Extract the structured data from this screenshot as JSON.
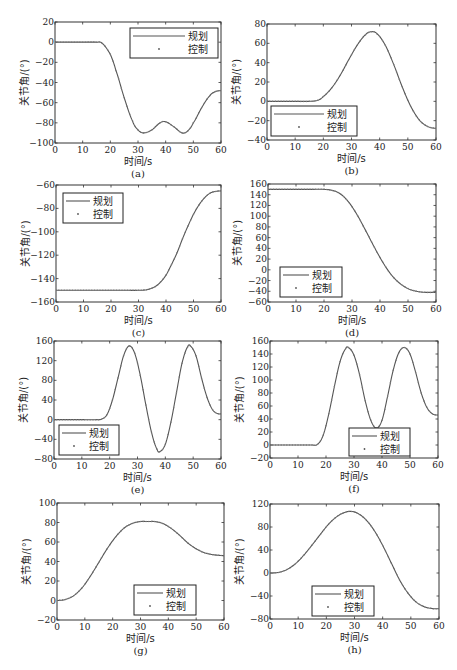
{
  "figure": {
    "legend_labels": [
      "规划",
      "控制"
    ],
    "xlabel": "时间/s",
    "ylabel": "关节角/(°)"
  },
  "chart_data": [
    {
      "id": "a",
      "caption": "(a)",
      "type": "line",
      "title": "",
      "xlabel": "时间/s",
      "ylabel": "关节角/(°)",
      "xlim": [
        0,
        60
      ],
      "ylim": [
        -100,
        20
      ],
      "xticks": [
        0,
        10,
        20,
        30,
        40,
        50,
        60
      ],
      "yticks": [
        -100,
        -80,
        -60,
        -40,
        -20,
        0,
        20
      ],
      "grid": false,
      "legend_position": "upper right",
      "legend": [
        "规划",
        "控制"
      ],
      "x": [
        0,
        5,
        10,
        15,
        17,
        20,
        22,
        25,
        28,
        30,
        32,
        35,
        38,
        40,
        43,
        46,
        48,
        50,
        53,
        56,
        58,
        60
      ],
      "series": [
        {
          "name": "规划",
          "style": "line",
          "values": [
            0,
            0,
            0,
            0,
            -1,
            -12,
            -28,
            -55,
            -78,
            -87,
            -90,
            -87,
            -80,
            -79,
            -84,
            -90,
            -88,
            -80,
            -65,
            -53,
            -49,
            -48
          ]
        },
        {
          "name": "控制",
          "style": "dots",
          "values": [
            0,
            0,
            0,
            0,
            -1,
            -12,
            -28,
            -55,
            -78,
            -87,
            -90,
            -87,
            -80,
            -79,
            -84,
            -90,
            -88,
            -80,
            -65,
            -53,
            -49,
            -48
          ]
        }
      ]
    },
    {
      "id": "b",
      "caption": "(b)",
      "type": "line",
      "title": "",
      "xlabel": "时间/s",
      "ylabel": "关节角/(°)",
      "xlim": [
        0,
        60
      ],
      "ylim": [
        -40,
        80
      ],
      "xticks": [
        0,
        10,
        20,
        30,
        40,
        50,
        60
      ],
      "yticks": [
        -40,
        -20,
        0,
        20,
        40,
        60,
        80
      ],
      "grid": false,
      "legend_position": "lower left",
      "legend": [
        "规划",
        "控制"
      ],
      "x": [
        0,
        5,
        10,
        15,
        18,
        20,
        23,
        26,
        29,
        32,
        35,
        37,
        39,
        42,
        45,
        48,
        51,
        54,
        57,
        60
      ],
      "series": [
        {
          "name": "规划",
          "style": "line",
          "values": [
            0,
            0,
            0,
            0,
            1,
            5,
            14,
            27,
            43,
            58,
            69,
            72,
            70,
            58,
            38,
            15,
            -5,
            -19,
            -26,
            -28
          ]
        },
        {
          "name": "控制",
          "style": "dots",
          "values": [
            0,
            0,
            0,
            0,
            1,
            5,
            14,
            27,
            43,
            58,
            69,
            72,
            70,
            58,
            38,
            15,
            -5,
            -19,
            -26,
            -28
          ]
        }
      ]
    },
    {
      "id": "c",
      "caption": "(c)",
      "type": "line",
      "title": "",
      "xlabel": "时间/s",
      "ylabel": "关节角/(°)",
      "xlim": [
        0,
        60
      ],
      "ylim": [
        -160,
        -60
      ],
      "xticks": [
        0,
        10,
        20,
        30,
        40,
        50,
        60
      ],
      "yticks": [
        -160,
        -140,
        -120,
        -100,
        -80,
        -60
      ],
      "grid": false,
      "legend_position": "upper left",
      "legend": [
        "规划",
        "控制"
      ],
      "x": [
        0,
        5,
        10,
        15,
        20,
        25,
        30,
        33,
        36,
        38,
        40,
        42,
        44,
        46,
        48,
        50,
        52,
        54,
        56,
        58,
        60
      ],
      "series": [
        {
          "name": "规划",
          "style": "line",
          "values": [
            -150,
            -150,
            -150,
            -150,
            -150,
            -150,
            -150,
            -149.5,
            -147,
            -143,
            -137,
            -128,
            -118,
            -106,
            -95,
            -85,
            -77,
            -71,
            -67,
            -65.5,
            -65
          ]
        },
        {
          "name": "控制",
          "style": "dots",
          "values": [
            -150,
            -150,
            -150,
            -150,
            -150,
            -150,
            -150,
            -149.5,
            -147,
            -143,
            -137,
            -128,
            -118,
            -106,
            -95,
            -85,
            -77,
            -71,
            -67,
            -65.5,
            -65
          ]
        }
      ]
    },
    {
      "id": "d",
      "caption": "(d)",
      "type": "line",
      "title": "",
      "xlabel": "时间/s",
      "ylabel": "关节角/(°)",
      "xlim": [
        0,
        60
      ],
      "ylim": [
        -60,
        160
      ],
      "xticks": [
        0,
        10,
        20,
        30,
        40,
        50,
        60
      ],
      "yticks": [
        -60,
        -40,
        -20,
        0,
        20,
        40,
        60,
        80,
        100,
        120,
        140,
        160
      ],
      "grid": false,
      "legend_position": "lower left",
      "legend": [
        "规划",
        "控制"
      ],
      "x": [
        0,
        5,
        10,
        15,
        20,
        23,
        26,
        29,
        32,
        35,
        38,
        41,
        44,
        47,
        50,
        53,
        56,
        60
      ],
      "series": [
        {
          "name": "规划",
          "style": "line",
          "values": [
            150,
            150,
            150,
            150,
            150,
            148,
            141,
            125,
            101,
            72,
            42,
            14,
            -9,
            -25,
            -35,
            -40,
            -42,
            -42
          ]
        },
        {
          "name": "控制",
          "style": "dots",
          "values": [
            150,
            150,
            150,
            150,
            150,
            148,
            141,
            125,
            101,
            72,
            42,
            14,
            -9,
            -25,
            -35,
            -40,
            -42,
            -42
          ]
        }
      ]
    },
    {
      "id": "e",
      "caption": "(e)",
      "type": "line",
      "title": "",
      "xlabel": "时间/s",
      "ylabel": "关节角/(°)",
      "xlim": [
        0,
        60
      ],
      "ylim": [
        -80,
        160
      ],
      "xticks": [
        0,
        10,
        20,
        30,
        40,
        50,
        60
      ],
      "yticks": [
        -80,
        -40,
        0,
        40,
        80,
        120,
        160
      ],
      "grid": false,
      "legend_position": "lower left",
      "legend": [
        "规划",
        "控制"
      ],
      "x": [
        0,
        5,
        10,
        15,
        17,
        19,
        21,
        23,
        25,
        27,
        29,
        31,
        33,
        35,
        37,
        38,
        40,
        42,
        44,
        46,
        48,
        49,
        51,
        53,
        55,
        57,
        59,
        60
      ],
      "series": [
        {
          "name": "规划",
          "style": "line",
          "values": [
            0,
            0,
            0,
            0,
            1,
            10,
            40,
            85,
            130,
            150,
            135,
            90,
            30,
            -25,
            -60,
            -65,
            -50,
            -5,
            55,
            115,
            148,
            150,
            130,
            85,
            45,
            20,
            12,
            12
          ]
        },
        {
          "name": "控制",
          "style": "dots",
          "values": [
            0,
            0,
            0,
            0,
            1,
            10,
            40,
            85,
            130,
            150,
            135,
            90,
            30,
            -25,
            -60,
            -65,
            -50,
            -5,
            55,
            115,
            148,
            150,
            130,
            85,
            45,
            20,
            12,
            12
          ]
        }
      ]
    },
    {
      "id": "f",
      "caption": "(f)",
      "type": "line",
      "title": "",
      "xlabel": "时间/s",
      "ylabel": "关节角/(°)",
      "xlim": [
        0,
        60
      ],
      "ylim": [
        -20,
        160
      ],
      "xticks": [
        0,
        10,
        20,
        30,
        40,
        50,
        60
      ],
      "yticks": [
        -20,
        0,
        20,
        40,
        60,
        80,
        100,
        120,
        140,
        160
      ],
      "grid": false,
      "legend_position": "lower right",
      "legend": [
        "规划",
        "控制"
      ],
      "x": [
        0,
        5,
        10,
        15,
        17,
        19,
        21,
        23,
        25,
        27,
        28,
        30,
        32,
        34,
        36,
        38,
        40,
        42,
        44,
        46,
        48,
        50,
        52,
        54,
        56,
        58,
        60
      ],
      "series": [
        {
          "name": "规划",
          "style": "line",
          "values": [
            0,
            0,
            0,
            0,
            1,
            15,
            48,
            90,
            128,
            148,
            150,
            138,
            108,
            68,
            38,
            26,
            38,
            75,
            115,
            142,
            150,
            140,
            112,
            80,
            58,
            48,
            46
          ]
        },
        {
          "name": "控制",
          "style": "dots",
          "values": [
            0,
            0,
            0,
            0,
            1,
            15,
            48,
            90,
            128,
            148,
            150,
            138,
            108,
            68,
            38,
            26,
            38,
            75,
            115,
            142,
            150,
            140,
            112,
            80,
            58,
            48,
            46
          ]
        }
      ]
    },
    {
      "id": "g",
      "caption": "(g)",
      "type": "line",
      "title": "",
      "xlabel": "时间/s",
      "ylabel": "关节角/(°)",
      "xlim": [
        0,
        60
      ],
      "ylim": [
        -20,
        100
      ],
      "xticks": [
        0,
        10,
        20,
        30,
        40,
        50,
        60
      ],
      "yticks": [
        -20,
        0,
        20,
        40,
        60,
        80,
        100
      ],
      "grid": false,
      "legend_position": "lower right",
      "legend": [
        "规划",
        "控制"
      ],
      "x": [
        0,
        3,
        6,
        9,
        12,
        15,
        18,
        21,
        24,
        27,
        30,
        33,
        35,
        38,
        41,
        44,
        47,
        50,
        53,
        56,
        60
      ],
      "series": [
        {
          "name": "规划",
          "style": "line",
          "values": [
            0,
            1,
            5,
            13,
            25,
            39,
            53,
            65,
            74,
            79,
            81,
            81,
            81,
            79,
            74,
            67,
            59,
            53,
            49,
            47,
            46
          ]
        },
        {
          "name": "控制",
          "style": "dots",
          "values": [
            0,
            1,
            5,
            13,
            25,
            39,
            53,
            65,
            74,
            79,
            81,
            81,
            81,
            79,
            74,
            67,
            59,
            53,
            49,
            47,
            46
          ]
        }
      ]
    },
    {
      "id": "h",
      "caption": "(h)",
      "type": "line",
      "title": "",
      "xlabel": "时间/s",
      "ylabel": "关节角/(°)",
      "xlim": [
        0,
        60
      ],
      "ylim": [
        -80,
        120
      ],
      "xticks": [
        0,
        10,
        20,
        30,
        40,
        50,
        60
      ],
      "yticks": [
        -80,
        -40,
        0,
        40,
        80,
        120
      ],
      "grid": false,
      "legend_position": "lower center",
      "legend": [
        "规划",
        "控制"
      ],
      "x": [
        0,
        3,
        6,
        9,
        12,
        15,
        18,
        21,
        24,
        27,
        29,
        31,
        34,
        37,
        40,
        43,
        46,
        49,
        52,
        55,
        58,
        60
      ],
      "series": [
        {
          "name": "规划",
          "style": "line",
          "values": [
            0,
            1,
            6,
            16,
            31,
            49,
            68,
            86,
            99,
            106,
            107,
            104,
            93,
            74,
            48,
            18,
            -12,
            -35,
            -51,
            -59,
            -62,
            -62
          ]
        },
        {
          "name": "控制",
          "style": "dots",
          "values": [
            0,
            1,
            6,
            16,
            31,
            49,
            68,
            86,
            99,
            106,
            107,
            104,
            93,
            74,
            48,
            18,
            -12,
            -35,
            -51,
            -59,
            -62,
            -62
          ]
        }
      ]
    }
  ],
  "layout": {
    "panels": [
      {
        "left": 55,
        "top": 22,
        "right": 221,
        "bottom": 143,
        "legend": {
          "x": 130,
          "y": 28,
          "w": 88,
          "h": 30
        }
      },
      {
        "left": 267,
        "top": 24,
        "right": 436,
        "bottom": 140,
        "legend": {
          "x": 271,
          "y": 106,
          "w": 86,
          "h": 30
        }
      },
      {
        "left": 56,
        "top": 185,
        "right": 221,
        "bottom": 302,
        "legend": {
          "x": 63,
          "y": 193,
          "w": 60,
          "h": 30
        }
      },
      {
        "left": 268,
        "top": 184,
        "right": 436,
        "bottom": 302,
        "legend": {
          "x": 280,
          "y": 267,
          "w": 62,
          "h": 30
        }
      },
      {
        "left": 54,
        "top": 341,
        "right": 221,
        "bottom": 459,
        "legend": {
          "x": 59,
          "y": 425,
          "w": 60,
          "h": 30
        }
      },
      {
        "left": 270,
        "top": 341,
        "right": 438,
        "bottom": 458,
        "legend": {
          "x": 349,
          "y": 428,
          "w": 61,
          "h": 28
        }
      },
      {
        "left": 57,
        "top": 503,
        "right": 224,
        "bottom": 620,
        "legend": {
          "x": 134,
          "y": 585,
          "w": 62,
          "h": 30
        }
      },
      {
        "left": 270,
        "top": 504,
        "right": 439,
        "bottom": 619,
        "legend": {
          "x": 312,
          "y": 586,
          "w": 62,
          "h": 30
        }
      }
    ]
  }
}
